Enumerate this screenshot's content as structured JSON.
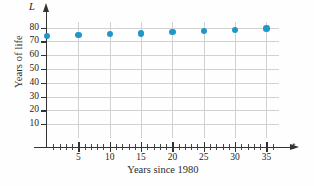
{
  "chart_data": {
    "type": "scatter",
    "title": "",
    "xlabel": "Years since 1980",
    "ylabel": "Years of life",
    "x_variable": "t",
    "y_variable": "L",
    "xlim": [
      0,
      37
    ],
    "ylim": [
      0,
      84
    ],
    "x_ticks": [
      5,
      10,
      15,
      20,
      25,
      30,
      35
    ],
    "x_tick_labels": [
      "5",
      "10",
      "15",
      "20",
      "25",
      "30",
      "35"
    ],
    "x_minor_tick_step": 1,
    "y_ticks": [
      10,
      20,
      30,
      40,
      50,
      60,
      70,
      80
    ],
    "y_tick_labels": [
      "10",
      "20",
      "30",
      "40",
      "50",
      "60",
      "70",
      "80"
    ],
    "grid": true,
    "grid_color": "#d2d2d2",
    "legend": false,
    "point_color": "#2196c9",
    "x": [
      0,
      5,
      10,
      15,
      20,
      25,
      30,
      35
    ],
    "values": [
      73.7,
      74.7,
      75.4,
      75.8,
      76.8,
      77.5,
      78.2,
      79.3
    ],
    "points": [
      {
        "t": 0,
        "L": 73.7
      },
      {
        "t": 5,
        "L": 74.7
      },
      {
        "t": 10,
        "L": 75.4
      },
      {
        "t": 15,
        "L": 75.8
      },
      {
        "t": 20,
        "L": 76.8
      },
      {
        "t": 25,
        "L": 77.5
      },
      {
        "t": 30,
        "L": 78.2
      },
      {
        "t": 35,
        "L": 79.3
      }
    ]
  }
}
